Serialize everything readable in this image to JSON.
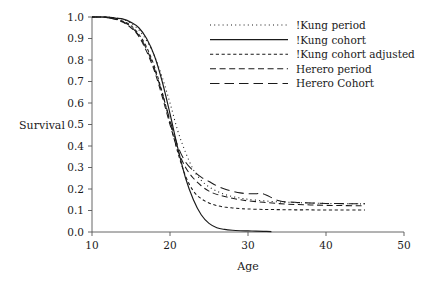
{
  "chart_data": {
    "type": "line",
    "title": "",
    "xlabel": "Age",
    "ylabel": "Survival",
    "xlim": [
      10,
      50
    ],
    "ylim": [
      0.0,
      1.0
    ],
    "xticks": [
      10,
      20,
      30,
      40,
      50
    ],
    "yticks": [
      "0.0",
      "0.1",
      "0.2",
      "0.3",
      "0.4",
      "0.5",
      "0.6",
      "0.7",
      "0.8",
      "0.9",
      "1.0"
    ],
    "grid": false,
    "legend_position": "top-right",
    "series": [
      {
        "name": "!Kung period",
        "style": "dotted",
        "x": [
          10,
          11,
          12,
          13,
          14,
          15,
          16,
          17,
          18,
          19,
          20,
          21,
          22,
          23,
          24,
          25,
          26,
          27,
          28,
          29,
          30,
          32,
          34,
          36,
          38,
          40,
          42,
          44,
          45
        ],
        "y": [
          1.0,
          1.0,
          1.0,
          0.995,
          0.99,
          0.97,
          0.94,
          0.89,
          0.82,
          0.72,
          0.6,
          0.47,
          0.37,
          0.29,
          0.24,
          0.21,
          0.19,
          0.175,
          0.165,
          0.158,
          0.152,
          0.145,
          0.14,
          0.137,
          0.135,
          0.133,
          0.132,
          0.131,
          0.131
        ]
      },
      {
        "name": "!Kung cohort",
        "style": "solid",
        "x": [
          10,
          11,
          12,
          13,
          14,
          15,
          16,
          17,
          18,
          19,
          20,
          21,
          22,
          23,
          24,
          25,
          26,
          27,
          28,
          29,
          30,
          31,
          32,
          33
        ],
        "y": [
          1.0,
          1.0,
          1.0,
          0.995,
          0.99,
          0.975,
          0.95,
          0.9,
          0.82,
          0.7,
          0.55,
          0.39,
          0.25,
          0.15,
          0.08,
          0.04,
          0.02,
          0.012,
          0.008,
          0.006,
          0.005,
          0.004,
          0.003,
          0.002
        ]
      },
      {
        "name": "!Kung cohort adjusted",
        "style": "short-dash",
        "x": [
          10,
          11,
          12,
          13,
          14,
          15,
          16,
          17,
          18,
          19,
          20,
          21,
          22,
          23,
          24,
          25,
          26,
          27,
          28,
          29,
          30,
          32,
          34,
          36,
          38,
          40,
          42,
          44,
          45
        ],
        "y": [
          1.0,
          1.0,
          0.998,
          0.99,
          0.98,
          0.96,
          0.92,
          0.86,
          0.77,
          0.65,
          0.51,
          0.37,
          0.26,
          0.19,
          0.155,
          0.135,
          0.123,
          0.116,
          0.112,
          0.109,
          0.107,
          0.105,
          0.104,
          0.103,
          0.103,
          0.102,
          0.102,
          0.102,
          0.102
        ]
      },
      {
        "name": "Herero period",
        "style": "medium-dash",
        "x": [
          10,
          11,
          12,
          13,
          14,
          15,
          16,
          17,
          18,
          19,
          20,
          21,
          22,
          23,
          24,
          25,
          26,
          27,
          28,
          29,
          30,
          32,
          34,
          36,
          38,
          40,
          42,
          44,
          45
        ],
        "y": [
          1.0,
          1.0,
          0.997,
          0.99,
          0.975,
          0.95,
          0.91,
          0.84,
          0.75,
          0.63,
          0.5,
          0.38,
          0.3,
          0.25,
          0.215,
          0.19,
          0.175,
          0.165,
          0.157,
          0.15,
          0.145,
          0.138,
          0.132,
          0.128,
          0.126,
          0.124,
          0.123,
          0.122,
          0.122
        ]
      },
      {
        "name": "Herero Cohort",
        "style": "long-dash",
        "x": [
          10,
          11,
          12,
          13,
          14,
          15,
          16,
          17,
          18,
          19,
          20,
          21,
          22,
          23,
          24,
          25,
          26,
          27,
          28,
          29,
          30,
          31,
          32,
          34,
          36,
          38,
          40,
          42,
          44,
          45
        ],
        "y": [
          1.0,
          1.0,
          0.997,
          0.99,
          0.978,
          0.955,
          0.915,
          0.85,
          0.76,
          0.645,
          0.52,
          0.4,
          0.325,
          0.285,
          0.255,
          0.235,
          0.215,
          0.2,
          0.19,
          0.182,
          0.178,
          0.178,
          0.177,
          0.145,
          0.138,
          0.135,
          0.133,
          0.132,
          0.131,
          0.131
        ]
      }
    ]
  },
  "legend": {
    "items": [
      {
        "label": "!Kung period"
      },
      {
        "label": "!Kung cohort"
      },
      {
        "label": "!Kung cohort adjusted"
      },
      {
        "label": "Herero period"
      },
      {
        "label": "Herero Cohort"
      }
    ]
  },
  "axes": {
    "y_title": "Survival",
    "x_title": "Age",
    "x_ticks": [
      "10",
      "20",
      "30",
      "40",
      "50"
    ],
    "y_ticks": [
      "1.0",
      "0.9",
      "0.8",
      "0.7",
      "0.6",
      "0.5",
      "0.4",
      "0.3",
      "0.2",
      "0.1",
      "0.0"
    ]
  },
  "colors": {
    "line": "#1a1a1a",
    "axis": "#555555",
    "background": "#ffffff"
  }
}
